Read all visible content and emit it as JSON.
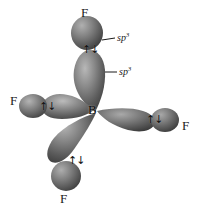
{
  "figure": {
    "background_color": "#ffffff",
    "ink_color": "#1a1a1a",
    "lobe_color_dark": "#4a4a4a",
    "lobe_color_mid": "#7d7d7d",
    "lobe_color_light": "#c9c9c9"
  },
  "central_atom": {
    "symbol": "B",
    "name": "boron"
  },
  "electron_pair_symbol": "↑↓",
  "hybrid_labels": [
    {
      "text": "sp",
      "exponent": "3"
    },
    {
      "text": "sp",
      "exponent": "3"
    }
  ],
  "bonds": [
    {
      "id": "bond-top",
      "terminal_atom": "F",
      "direction": "up",
      "electron_pair": "↑↓"
    },
    {
      "id": "bond-left",
      "terminal_atom": "F",
      "direction": "left",
      "electron_pair": "↑↓"
    },
    {
      "id": "bond-right",
      "terminal_atom": "F",
      "direction": "right",
      "electron_pair": "↑↓"
    },
    {
      "id": "bond-bottom",
      "terminal_atom": "F",
      "direction": "down-left",
      "electron_pair": "↑↓"
    }
  ]
}
